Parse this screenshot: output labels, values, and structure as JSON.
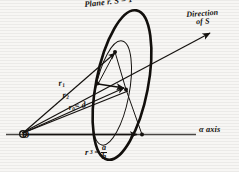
{
  "figure": {
    "title_label": "Plane r. S = 1",
    "direction_label_line1": "Direction",
    "direction_label_line2": "of S",
    "origin_label": "O",
    "axis_label": "α axis",
    "vectors": [
      {
        "name": "r1",
        "label_base": "r",
        "label_sub": "1"
      },
      {
        "name": "r2",
        "label_base": "r",
        "label_sub": "2"
      },
      {
        "name": "r0",
        "label_base": "r",
        "label_sub": "0",
        "label_tail": "= d"
      }
    ],
    "intercept": {
      "label_base": "r",
      "label_sub": "3",
      "equals": "=",
      "numerator": "a",
      "denominator": "h"
    },
    "colors": {
      "ink": "#15120f",
      "paper": "#f7f6f4",
      "axis": "#4a4744"
    }
  }
}
